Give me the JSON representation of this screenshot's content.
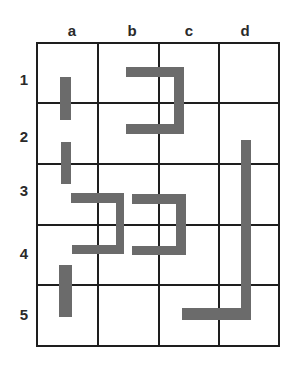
{
  "diagram": {
    "type": "grid-puzzle",
    "columns": [
      "a",
      "b",
      "c",
      "d"
    ],
    "rows": [
      "1",
      "2",
      "3",
      "4",
      "5"
    ],
    "grid": {
      "x_lines": [
        37,
        98,
        159,
        219,
        279
      ],
      "y_lines": [
        43,
        103,
        164,
        225,
        285,
        346
      ],
      "line_color": "#1e1e1e"
    },
    "column_label_positions": [
      {
        "x": 72,
        "y": 30
      },
      {
        "x": 132,
        "y": 30
      },
      {
        "x": 189,
        "y": 30
      },
      {
        "x": 245,
        "y": 30
      }
    ],
    "row_label_positions": [
      {
        "x": 24,
        "y": 79
      },
      {
        "x": 24,
        "y": 136
      },
      {
        "x": 24,
        "y": 190
      },
      {
        "x": 24,
        "y": 253
      },
      {
        "x": 24,
        "y": 314
      }
    ],
    "shape_color": "#6b6b6b",
    "shapes": [
      {
        "name": "bar-a1-a2",
        "cells": [
          "a1",
          "a2"
        ],
        "rects": [
          [
            60,
            77,
            11,
            43
          ]
        ]
      },
      {
        "name": "bracket-b1-c2",
        "cells": [
          "b1",
          "c1",
          "b2",
          "c2"
        ],
        "rects": [
          [
            126,
            67,
            57,
            10
          ],
          [
            174,
            67,
            10,
            67
          ],
          [
            126,
            124,
            58,
            10
          ]
        ]
      },
      {
        "name": "bar-a2-a3",
        "cells": [
          "a2",
          "a3"
        ],
        "rects": [
          [
            61,
            142,
            10,
            42
          ]
        ]
      },
      {
        "name": "bracket-a3-b4",
        "cells": [
          "a3",
          "b3",
          "a4",
          "b4"
        ],
        "rects": [
          [
            71,
            193,
            52,
            10
          ],
          [
            116,
            193,
            8,
            60
          ],
          [
            72,
            245,
            52,
            9
          ]
        ]
      },
      {
        "name": "bracket-b3-c4",
        "cells": [
          "b3",
          "c3",
          "b4",
          "c4"
        ],
        "rects": [
          [
            132,
            194,
            54,
            10
          ],
          [
            176,
            194,
            10,
            61
          ],
          [
            132,
            246,
            54,
            9
          ]
        ]
      },
      {
        "name": "l-shape-d2-c5",
        "cells": [
          "d2",
          "d3",
          "d4",
          "d5",
          "c5"
        ],
        "rects": [
          [
            241,
            140,
            10,
            180
          ],
          [
            182,
            308,
            69,
            12
          ]
        ]
      },
      {
        "name": "bar-a4-a5",
        "cells": [
          "a4",
          "a5"
        ],
        "rects": [
          [
            59,
            265,
            13,
            52
          ]
        ]
      }
    ]
  }
}
